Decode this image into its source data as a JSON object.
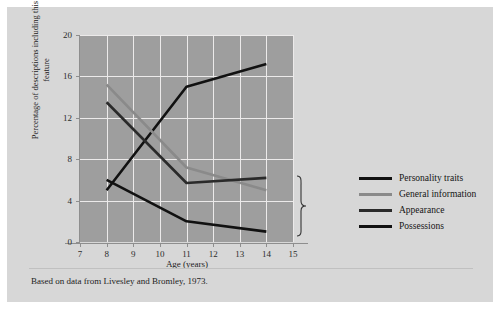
{
  "figure": {
    "caption": "Based on data from Livesley and Bromley, 1973.",
    "panel_color": "#d7d7d7",
    "plot_color": "#9e9e9e",
    "grid_color": "#eceaea"
  },
  "legend": {
    "position": "right",
    "items": [
      {
        "label": "Personality traits",
        "color": "#111111"
      },
      {
        "label": "General information",
        "color": "#8a8a8a"
      },
      {
        "label": "Appearance",
        "color": "#2a2a2a"
      },
      {
        "label": "Possessions",
        "color": "#111111"
      }
    ]
  },
  "chart_data": {
    "type": "line",
    "title": "",
    "subtitle": "",
    "xlabel": "Age (years)",
    "ylabel": "Percentage of descriptions including this feature",
    "xlim": [
      7,
      15
    ],
    "ylim": [
      0,
      20
    ],
    "xticks": [
      7,
      8,
      9,
      10,
      11,
      12,
      13,
      14,
      15
    ],
    "yticks": [
      0,
      4,
      8,
      12,
      16,
      20
    ],
    "xtick_labels": [
      "7",
      "8",
      "9",
      "10",
      "11",
      "12",
      "13",
      "14",
      "15"
    ],
    "ytick_labels": [
      "0",
      "4",
      "8",
      "12",
      "16",
      "20"
    ],
    "grid": true,
    "x": [
      8,
      11,
      14
    ],
    "series": [
      {
        "name": "Personality traits",
        "color": "#111111",
        "values": [
          5.0,
          15.0,
          17.2
        ]
      },
      {
        "name": "General information",
        "color": "#8a8a8a",
        "values": [
          15.2,
          7.2,
          5.0
        ]
      },
      {
        "name": "Appearance",
        "color": "#2a2a2a",
        "values": [
          13.5,
          5.7,
          6.2
        ]
      },
      {
        "name": "Possessions",
        "color": "#111111",
        "values": [
          6.0,
          2.0,
          1.0
        ]
      }
    ],
    "annotations": [
      {
        "type": "brace",
        "note": "curly brace grouping the three lower series at age 14"
      }
    ]
  }
}
